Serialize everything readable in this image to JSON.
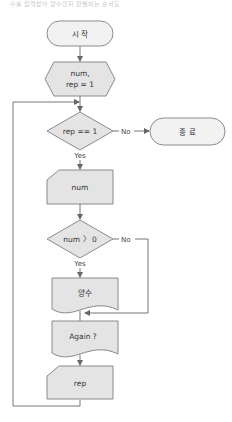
{
  "caption": "수를 입력받아 양수인지 판별하는 순서도",
  "colors": {
    "shape_fill": "#e4e4e4",
    "terminator_fill": "#f2f2f2",
    "stroke": "#8a8a8a",
    "text": "#333333"
  },
  "flowchart": {
    "start": {
      "label": "시 작",
      "shape": "terminator"
    },
    "init": {
      "label_line1": "num,",
      "label_line2": "rep = 1",
      "shape": "preparation"
    },
    "decision_rep": {
      "label": "rep == 1",
      "shape": "decision",
      "yes": "Yes",
      "no": "No"
    },
    "end": {
      "label": "종 료",
      "shape": "terminator"
    },
    "input_num": {
      "label": "num",
      "shape": "manual-input"
    },
    "decision_num": {
      "label": "num 〉 0",
      "shape": "decision",
      "yes": "Yes",
      "no": "No"
    },
    "output_positive": {
      "label": "양수",
      "shape": "document"
    },
    "output_again": {
      "label": "Again ?",
      "shape": "document"
    },
    "input_rep": {
      "label": "rep",
      "shape": "manual-input"
    }
  }
}
